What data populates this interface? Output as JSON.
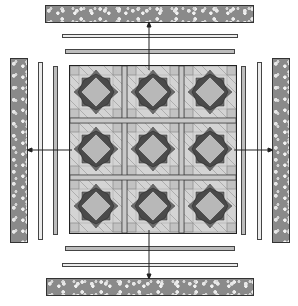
{
  "diagram": {
    "title": "",
    "grid": {
      "rows": 3,
      "cols": 3,
      "block_name": "star block"
    },
    "borders": {
      "top": [
        "inner strip (medium)",
        "inner strip (light)",
        "floral outer border"
      ],
      "bottom": [
        "inner strip (medium)",
        "inner strip (light)",
        "floral outer border"
      ],
      "left": [
        "inner strip (medium)",
        "inner strip (light)",
        "floral outer border"
      ],
      "right": [
        "inner strip (medium)",
        "inner strip (light)",
        "floral outer border"
      ]
    },
    "arrows": [
      "up",
      "down",
      "left",
      "right"
    ],
    "colors": {
      "floral": "#8a8a8a",
      "light_strip": "#ececec",
      "medium_strip": "#bdbdbd",
      "star_dark": "#6e6e6e",
      "center_square": "#b8b8b8",
      "background": "#ffffff"
    }
  }
}
